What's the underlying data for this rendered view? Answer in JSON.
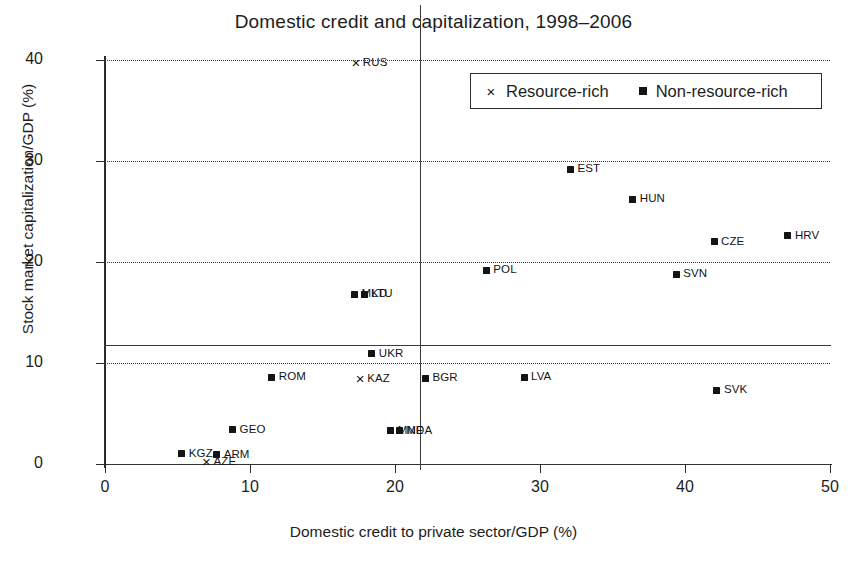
{
  "chart_data": {
    "type": "scatter",
    "title": "Domestic credit and capitalization, 1998–2006",
    "xlabel": "Domestic credit to private sector/GDP (%)",
    "ylabel": "Stock market capitalization/GDP (%)",
    "xlim": [
      0,
      50
    ],
    "ylim": [
      0,
      40
    ],
    "xticks": [
      0,
      10,
      20,
      30,
      40,
      50
    ],
    "yticks": [
      0,
      10,
      20,
      30,
      40
    ],
    "grid": "horizontal-dotted",
    "legend_position": "top-right",
    "reference_lines": {
      "vertical_x": 21.7,
      "horizontal_y": 11.8
    },
    "series": [
      {
        "name": "Resource-rich",
        "marker": "cross",
        "marker_glyph": "×",
        "points": [
          {
            "label": "RUS",
            "x": 17.3,
            "y": 39.7,
            "label_pos": "right"
          },
          {
            "label": "KAZ",
            "x": 17.6,
            "y": 8.4,
            "label_pos": "right"
          },
          {
            "label": "AZE",
            "x": 7.0,
            "y": 0.2,
            "label_pos": "right"
          }
        ]
      },
      {
        "name": "Non-resource-rich",
        "marker": "square",
        "marker_glyph": "■",
        "points": [
          {
            "label": "EST",
            "x": 32.1,
            "y": 29.2,
            "label_pos": "right"
          },
          {
            "label": "HUN",
            "x": 36.4,
            "y": 26.2,
            "label_pos": "right"
          },
          {
            "label": "HRV",
            "x": 47.1,
            "y": 22.6,
            "label_pos": "right"
          },
          {
            "label": "CZE",
            "x": 42.0,
            "y": 22.0,
            "label_pos": "right"
          },
          {
            "label": "POL",
            "x": 26.3,
            "y": 19.2,
            "label_pos": "right"
          },
          {
            "label": "SVN",
            "x": 39.4,
            "y": 18.8,
            "label_pos": "right"
          },
          {
            "label": "MKD",
            "x": 17.2,
            "y": 16.8,
            "label_pos": "right"
          },
          {
            "label": "LTU",
            "x": 17.9,
            "y": 16.8,
            "label_pos": "right"
          },
          {
            "label": "UKR",
            "x": 18.4,
            "y": 10.9,
            "label_pos": "right"
          },
          {
            "label": "ROM",
            "x": 11.5,
            "y": 8.6,
            "label_pos": "right"
          },
          {
            "label": "BGR",
            "x": 22.1,
            "y": 8.5,
            "label_pos": "right"
          },
          {
            "label": "LVA",
            "x": 28.9,
            "y": 8.6,
            "label_pos": "right"
          },
          {
            "label": "SVK",
            "x": 42.2,
            "y": 7.3,
            "label_pos": "right"
          },
          {
            "label": "GEO",
            "x": 8.8,
            "y": 3.4,
            "label_pos": "right"
          },
          {
            "label": "MNE",
            "x": 19.7,
            "y": 3.3,
            "label_pos": "right"
          },
          {
            "label": "MDA",
            "x": 20.3,
            "y": 3.3,
            "label_pos": "right"
          },
          {
            "label": "KGZ",
            "x": 5.3,
            "y": 1.0,
            "label_pos": "right"
          },
          {
            "label": "ARM",
            "x": 7.7,
            "y": 0.9,
            "label_pos": "right"
          }
        ]
      }
    ]
  },
  "legend": {
    "entries": [
      {
        "marker": "cross-marker",
        "label": "Resource-rich"
      },
      {
        "marker": "square-marker",
        "label": "Non-resource-rich"
      }
    ]
  }
}
